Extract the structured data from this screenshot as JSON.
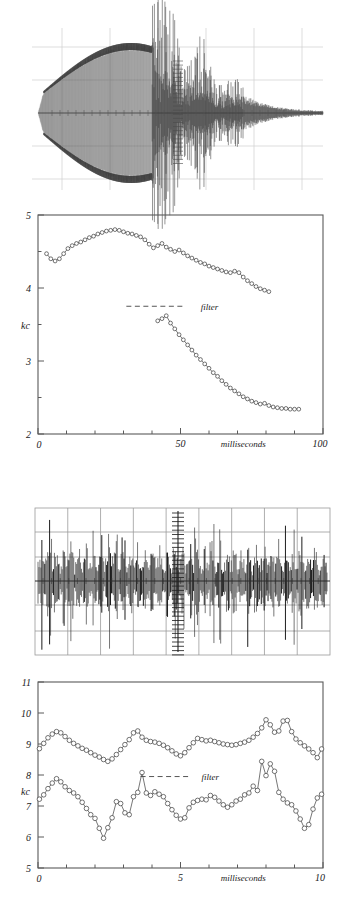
{
  "figure": {
    "panels": [
      {
        "name": "upper-oscillogram",
        "type": "waveform"
      },
      {
        "name": "upper-frequency-plot",
        "type": "line"
      },
      {
        "name": "lower-oscillogram",
        "type": "waveform"
      },
      {
        "name": "lower-frequency-plot",
        "type": "line"
      }
    ]
  },
  "chart_data": [
    {
      "type": "line",
      "panel": "upper-frequency-plot",
      "title": "",
      "xlabel": "milliseconds",
      "ylabel": "kc",
      "xlim": [
        0,
        100
      ],
      "ylim": [
        2,
        5
      ],
      "xticks": [
        0,
        50,
        100
      ],
      "xticklabels": [
        "0",
        "50",
        "100"
      ],
      "yticks": [
        2,
        3,
        4,
        5
      ],
      "yticklabels": [
        "2",
        "3",
        "4",
        "5"
      ],
      "minor_xticks": [
        10,
        20,
        30,
        40,
        60,
        70,
        80,
        90
      ],
      "minor_yticks": [
        2.5,
        3.5,
        4.5
      ],
      "grid": false,
      "legend": false,
      "annotations": [
        {
          "text": "filter",
          "x": 55,
          "y": 3.75,
          "dashed_line_from_x": 31,
          "dashed_line_to_x": 51
        }
      ],
      "marker": "open-circle",
      "series": [
        {
          "name": "upper-harmonic",
          "x": [
            3,
            4.5,
            6,
            7.5,
            9,
            10.5,
            12,
            13.5,
            15,
            16.5,
            18,
            19.5,
            21,
            22.5,
            24,
            25.5,
            27,
            28.5,
            30,
            31.5,
            33,
            34.5,
            36,
            37.5,
            39,
            40.5,
            42,
            43.5,
            45,
            46.5,
            48,
            49.5,
            51,
            52.5,
            54,
            55.5,
            57,
            58.5,
            60,
            61.5,
            63,
            64.5,
            66,
            67.5,
            69,
            70.5,
            72,
            73.5,
            75,
            76.5,
            78,
            79.5,
            81
          ],
          "y": [
            4.47,
            4.4,
            4.37,
            4.4,
            4.47,
            4.54,
            4.58,
            4.61,
            4.63,
            4.66,
            4.69,
            4.71,
            4.74,
            4.76,
            4.78,
            4.79,
            4.8,
            4.79,
            4.77,
            4.75,
            4.74,
            4.72,
            4.7,
            4.66,
            4.6,
            4.55,
            4.58,
            4.61,
            4.56,
            4.53,
            4.5,
            4.52,
            4.48,
            4.44,
            4.41,
            4.38,
            4.35,
            4.33,
            4.3,
            4.28,
            4.26,
            4.24,
            4.22,
            4.21,
            4.23,
            4.21,
            4.15,
            4.1,
            4.06,
            4.02,
            3.99,
            3.97,
            3.95
          ]
        },
        {
          "name": "lower-harmonic",
          "x": [
            42,
            43.5,
            45,
            46.5,
            48,
            49.5,
            51,
            52.5,
            54,
            55.5,
            57,
            58.5,
            60,
            61.5,
            63,
            64.5,
            66,
            67.5,
            69,
            70.5,
            72,
            73.5,
            75,
            76.5,
            78,
            79.5,
            81,
            82.5,
            84,
            85.5,
            87,
            88.5,
            90,
            91.5
          ],
          "y": [
            3.55,
            3.58,
            3.62,
            3.52,
            3.44,
            3.36,
            3.29,
            3.22,
            3.15,
            3.08,
            3.02,
            2.96,
            2.9,
            2.84,
            2.79,
            2.73,
            2.68,
            2.63,
            2.59,
            2.55,
            2.51,
            2.48,
            2.45,
            2.43,
            2.41,
            2.42,
            2.39,
            2.37,
            2.36,
            2.35,
            2.35,
            2.34,
            2.34,
            2.34
          ]
        }
      ]
    },
    {
      "type": "line",
      "panel": "lower-frequency-plot",
      "title": "",
      "xlabel": "milliseconds",
      "ylabel": "kc",
      "xlim": [
        0,
        10
      ],
      "ylim": [
        5,
        11
      ],
      "xticks": [
        0,
        5,
        10
      ],
      "xticklabels": [
        "0",
        "5",
        "10"
      ],
      "yticks": [
        5,
        6,
        7,
        8,
        9,
        10,
        11
      ],
      "yticklabels": [
        "5",
        "6",
        "7",
        "8",
        "9",
        "10",
        "11"
      ],
      "minor_xticks": [
        1,
        2,
        3,
        4,
        6,
        7,
        8,
        9
      ],
      "grid": false,
      "legend": false,
      "annotations": [
        {
          "text": "filter",
          "x": 5.6,
          "y": 7.95,
          "dashed_line_from_x": 3.6,
          "dashed_line_to_x": 5.3
        }
      ],
      "marker": "open-circle",
      "series": [
        {
          "name": "upper-harmonic",
          "x": [
            0.05,
            0.2,
            0.35,
            0.5,
            0.65,
            0.8,
            0.95,
            1.1,
            1.25,
            1.4,
            1.55,
            1.7,
            1.85,
            2.0,
            2.15,
            2.3,
            2.45,
            2.6,
            2.75,
            2.9,
            3.05,
            3.2,
            3.35,
            3.5,
            3.65,
            3.8,
            3.95,
            4.1,
            4.25,
            4.4,
            4.55,
            4.7,
            4.85,
            5.0,
            5.15,
            5.3,
            5.45,
            5.6,
            5.75,
            5.9,
            6.05,
            6.2,
            6.35,
            6.5,
            6.65,
            6.8,
            6.95,
            7.1,
            7.25,
            7.4,
            7.55,
            7.7,
            7.85,
            8.0,
            8.15,
            8.3,
            8.45,
            8.6,
            8.75,
            8.9,
            9.05,
            9.2,
            9.35,
            9.5,
            9.65,
            9.8,
            9.95
          ],
          "y": [
            8.85,
            9.02,
            9.2,
            9.32,
            9.4,
            9.36,
            9.24,
            9.12,
            9.02,
            8.94,
            8.86,
            8.8,
            8.72,
            8.64,
            8.58,
            8.5,
            8.44,
            8.52,
            8.66,
            8.82,
            8.98,
            9.14,
            9.36,
            9.42,
            9.22,
            9.12,
            9.08,
            9.06,
            9.02,
            8.96,
            8.88,
            8.78,
            8.68,
            8.62,
            8.72,
            8.88,
            9.04,
            9.18,
            9.14,
            9.1,
            9.12,
            9.08,
            9.04,
            9.0,
            8.98,
            8.96,
            8.98,
            9.02,
            9.06,
            9.12,
            9.22,
            9.34,
            9.52,
            9.78,
            9.62,
            9.38,
            9.42,
            9.74,
            9.76,
            9.4,
            9.16,
            9.04,
            8.94,
            8.84,
            8.72,
            8.56,
            8.84
          ]
        },
        {
          "name": "lower-harmonic",
          "x": [
            0.05,
            0.2,
            0.35,
            0.5,
            0.65,
            0.8,
            0.95,
            1.1,
            1.25,
            1.4,
            1.55,
            1.7,
            1.85,
            2.0,
            2.15,
            2.3,
            2.45,
            2.6,
            2.75,
            2.9,
            3.05,
            3.2,
            3.35,
            3.5,
            3.65,
            3.8,
            3.95,
            4.1,
            4.25,
            4.4,
            4.55,
            4.7,
            4.85,
            5.0,
            5.15,
            5.3,
            5.45,
            5.6,
            5.75,
            5.9,
            6.05,
            6.2,
            6.35,
            6.5,
            6.65,
            6.8,
            6.95,
            7.1,
            7.25,
            7.4,
            7.55,
            7.7,
            7.85,
            8.0,
            8.15,
            8.3,
            8.45,
            8.6,
            8.75,
            8.9,
            9.05,
            9.2,
            9.35,
            9.5,
            9.65,
            9.8,
            9.95
          ],
          "y": [
            7.22,
            7.36,
            7.56,
            7.74,
            7.88,
            7.78,
            7.62,
            7.5,
            7.42,
            7.3,
            7.12,
            6.92,
            6.72,
            6.6,
            6.28,
            5.96,
            6.3,
            6.62,
            7.14,
            7.08,
            6.78,
            6.72,
            7.3,
            7.44,
            8.08,
            7.42,
            7.34,
            7.46,
            7.38,
            7.3,
            7.08,
            6.88,
            6.7,
            6.58,
            6.62,
            6.94,
            7.12,
            7.18,
            7.22,
            7.2,
            7.34,
            7.28,
            7.16,
            7.04,
            6.96,
            7.04,
            7.16,
            7.22,
            7.36,
            7.42,
            7.64,
            7.5,
            8.44,
            7.98,
            8.36,
            8.12,
            7.44,
            7.22,
            7.1,
            7.04,
            6.84,
            6.58,
            6.28,
            6.4,
            6.9,
            7.26,
            7.38
          ]
        }
      ]
    }
  ]
}
